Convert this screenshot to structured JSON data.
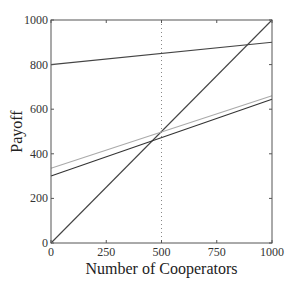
{
  "chart_data": {
    "type": "line",
    "title": "",
    "xlabel": "Number of Cooperators",
    "ylabel": "Payoff",
    "xlim": [
      0,
      1000
    ],
    "ylim": [
      0,
      1000
    ],
    "xticks": [
      0,
      250,
      500,
      750,
      1000
    ],
    "yticks": [
      0,
      200,
      400,
      600,
      800,
      1000
    ],
    "grid": false,
    "legend": null,
    "reference_lines": [
      {
        "orientation": "vertical",
        "x": 500,
        "style": "dotted",
        "color": "#888888"
      }
    ],
    "series": [
      {
        "name": "line-top",
        "x": [
          0,
          1000
        ],
        "y": [
          800,
          900
        ],
        "color": "#444444"
      },
      {
        "name": "line-diagonal",
        "x": [
          0,
          1000
        ],
        "y": [
          0,
          1000
        ],
        "color": "#444444"
      },
      {
        "name": "line-gray",
        "x": [
          0,
          1000
        ],
        "y": [
          335,
          660
        ],
        "color": "#aaaaaa"
      },
      {
        "name": "line-dark",
        "x": [
          0,
          1000
        ],
        "y": [
          300,
          645
        ],
        "color": "#333333"
      }
    ]
  }
}
